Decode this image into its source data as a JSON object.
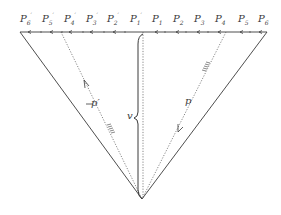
{
  "diagram": {
    "type": "geometric-construction",
    "colors": {
      "ink": "#3a3a3a",
      "background": "#ffffff"
    },
    "top_labels": [
      {
        "base": "P",
        "sub": "6",
        "prime": "′",
        "x": 20
      },
      {
        "base": "P",
        "sub": "5",
        "prime": "′",
        "x": 42
      },
      {
        "base": "P",
        "sub": "4",
        "prime": "′",
        "x": 64
      },
      {
        "base": "P",
        "sub": "3",
        "prime": "′",
        "x": 86
      },
      {
        "base": "P",
        "sub": "2",
        "prime": "′",
        "x": 107
      },
      {
        "base": "P",
        "sub": "1",
        "prime": "′",
        "x": 130
      },
      {
        "base": "P",
        "sub": "1",
        "prime": "",
        "x": 152
      },
      {
        "base": "P",
        "sub": "2",
        "prime": "",
        "x": 173
      },
      {
        "base": "P",
        "sub": "3",
        "prime": "",
        "x": 194
      },
      {
        "base": "P",
        "sub": "4",
        "prime": "",
        "x": 215
      },
      {
        "base": "P",
        "sub": "5",
        "prime": "",
        "x": 238
      },
      {
        "base": "P",
        "sub": "6",
        "prime": "",
        "x": 258
      }
    ],
    "annotations": {
      "brace_label": "v",
      "left_ray_label": "p′",
      "right_ray_label": "p"
    }
  }
}
